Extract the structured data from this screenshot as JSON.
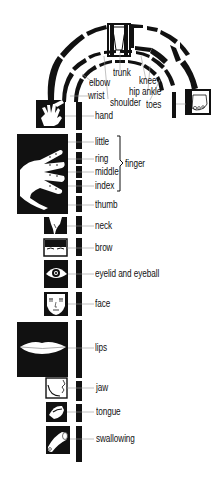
{
  "diagram": {
    "type": "motor homunculus map",
    "colors": {
      "ink": "#111111",
      "paper": "#ffffff",
      "leader": "#888888"
    },
    "arc_labels": [
      {
        "id": "trunk",
        "text": "trunk",
        "x": 113,
        "y": 73
      },
      {
        "id": "knee",
        "text": "knee",
        "x": 138,
        "y": 81
      },
      {
        "id": "elbow",
        "text": "elbow",
        "x": 89,
        "y": 83
      },
      {
        "id": "hip",
        "text": "hip",
        "x": 129,
        "y": 92
      },
      {
        "id": "ankle",
        "text": "ankle",
        "x": 142,
        "y": 92
      },
      {
        "id": "wrist",
        "text": "wrist",
        "x": 88,
        "y": 94
      },
      {
        "id": "shoulder",
        "text": "shoulder",
        "x": 110,
        "y": 100
      },
      {
        "id": "toes",
        "text": "toes",
        "x": 145,
        "y": 102
      },
      {
        "id": "hand",
        "text": "hand",
        "x": 94,
        "y": 113
      }
    ],
    "column_labels": [
      {
        "id": "little",
        "text": "little",
        "y": 141
      },
      {
        "id": "ring",
        "text": "ring",
        "y": 158
      },
      {
        "id": "middle",
        "text": "middle",
        "y": 171
      },
      {
        "id": "index",
        "text": "index",
        "y": 185
      },
      {
        "id": "thumb",
        "text": "thumb",
        "y": 204
      },
      {
        "id": "neck",
        "text": "neck",
        "y": 225
      },
      {
        "id": "brow",
        "text": "brow",
        "y": 247
      },
      {
        "id": "eyelid-and-eyeball",
        "text": "eyelid and eyeball",
        "y": 274
      },
      {
        "id": "face",
        "text": "face",
        "y": 304
      },
      {
        "id": "lips",
        "text": "lips",
        "y": 348
      },
      {
        "id": "jaw",
        "text": "jaw",
        "y": 388
      },
      {
        "id": "tongue",
        "text": "tongue",
        "y": 412
      },
      {
        "id": "swallowing",
        "text": "swallowing",
        "y": 439
      }
    ],
    "group_label": {
      "text": "finger",
      "x": 123,
      "y": 164
    },
    "icons": [
      "arm-icon",
      "trunk-icon",
      "leg-icon",
      "foot-icon",
      "hand-icon",
      "fingers-icon",
      "neck-icon",
      "brow-icon",
      "eye-icon",
      "face-icon",
      "lips-icon",
      "jaw-icon",
      "tongue-icon",
      "throat-icon"
    ]
  }
}
